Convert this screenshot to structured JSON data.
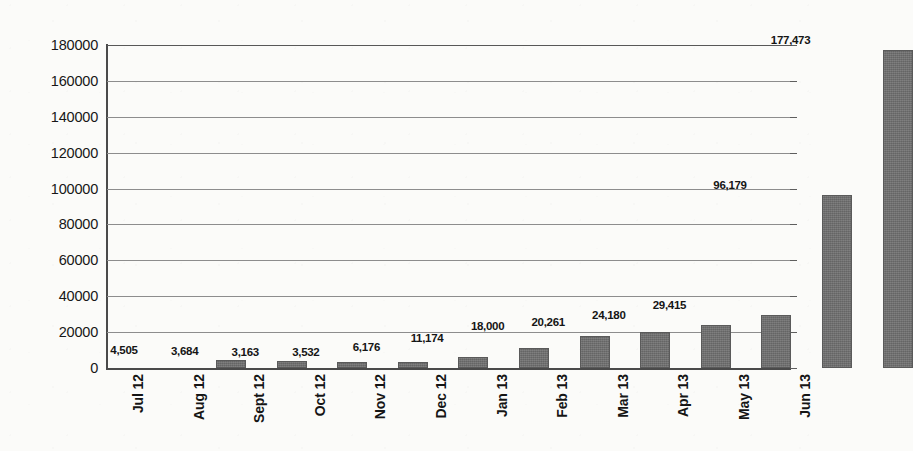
{
  "chart_data": {
    "type": "bar",
    "title": "",
    "subtitle": "",
    "xlabel": "",
    "ylabel": "",
    "categories": [
      "Jul 12",
      "Aug 12",
      "Sept 12",
      "Oct 12",
      "Nov 12",
      "Dec 12",
      "Jan 13",
      "Feb 13",
      "Mar 13",
      "Apr 13",
      "May 13",
      "Jun 13"
    ],
    "values": [
      4505,
      3684,
      3163,
      3532,
      6176,
      11174,
      18000,
      20261,
      24180,
      29415,
      96179,
      177473
    ],
    "value_labels": [
      "4,505",
      "3,684",
      "3,163",
      "3,532",
      "6,176",
      "11,174",
      "18,000",
      "20,261",
      "24,180",
      "29,415",
      "96,179",
      "177,473"
    ],
    "ylim": [
      0,
      180000
    ],
    "ytick_values": [
      0,
      20000,
      40000,
      60000,
      80000,
      100000,
      120000,
      140000,
      160000,
      180000
    ],
    "ytick_labels": [
      "0",
      "20000",
      "40000",
      "60000",
      "80000",
      "100000",
      "120000",
      "140000",
      "160000",
      "180000"
    ],
    "grid": "horizontal",
    "legend": "none",
    "series_count": 1,
    "bar_color": "#6e6e6e",
    "gridline_color": "#8d8d8d",
    "axis_color": "#4a4a4a",
    "background_color": "#fbfbf9",
    "text_color": "#151515",
    "xtick_rotation": 90,
    "data_labels_shown": true
  }
}
